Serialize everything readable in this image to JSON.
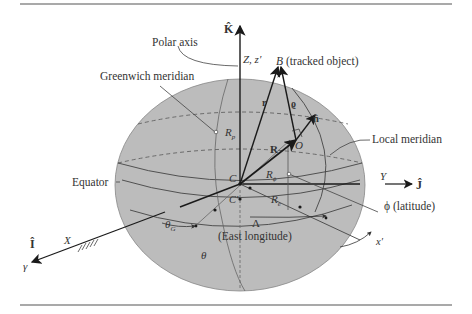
{
  "diagram": {
    "labels": {
      "k_hat": "K̂",
      "i_hat": "Î",
      "j_hat": "Ĵ",
      "polar_axis": "Polar axis",
      "greenwich_meridian": "Greenwich meridian",
      "z_axis": "Z, z′",
      "tracked_object": "B (tracked object)",
      "B": "B",
      "tracked_object_note": "(tracked object)",
      "r_vec": "r",
      "rho_vec": "ϱ",
      "n_hat": "n̂",
      "O": "O",
      "R_vec": "R",
      "R_p": "R",
      "R_p_sub": "p",
      "R_phi": "R",
      "R_phi_sub": "ϕ",
      "R_e": "R",
      "R_e_sub": "e",
      "local_meridian": "Local meridian",
      "equator": "Equator",
      "C": "C",
      "C_prime": "C′",
      "Y": "Y",
      "latitude": "ϕ (latitude)",
      "theta_G": "θ",
      "theta_G_sub": "G",
      "Lambda": "Λ",
      "east_longitude": "(East longitude)",
      "theta": "θ",
      "X": "X",
      "gamma": "γ",
      "x_prime": "x′"
    },
    "colors": {
      "ellipsoid_fill": "#bcbcbc",
      "line": "#1a1a1a",
      "thin_line": "#555555",
      "rule": "#555555"
    }
  }
}
